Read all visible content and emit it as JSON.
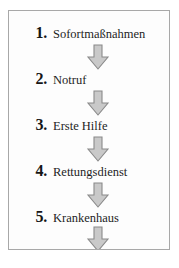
{
  "diagram": {
    "type": "vertical-flowchart",
    "frame": {
      "border_color": "#a8a8a8",
      "background_color": "#fdfdfd"
    },
    "arrow": {
      "icon": "arrow-down-block-icon",
      "fill_color": "#c9c9c9",
      "stroke_color": "#8a8a8a",
      "count": 5
    },
    "steps": [
      {
        "number": "1.",
        "label": "Sofortmaßnahmen"
      },
      {
        "number": "2.",
        "label": "Notruf"
      },
      {
        "number": "3.",
        "label": "Erste Hilfe"
      },
      {
        "number": "4.",
        "label": "Rettungsdienst"
      },
      {
        "number": "5.",
        "label": "Krankenhaus"
      }
    ]
  }
}
